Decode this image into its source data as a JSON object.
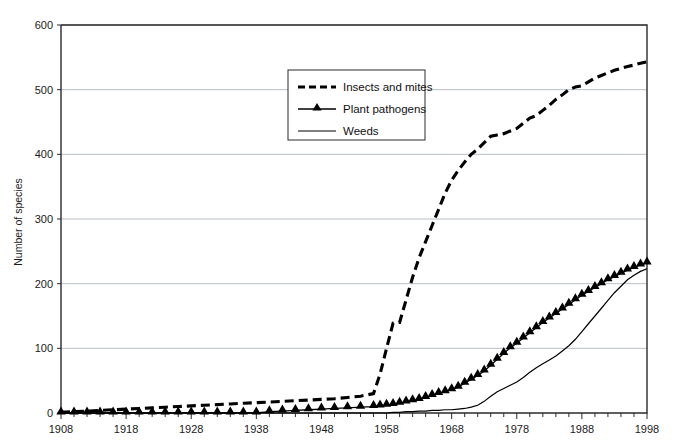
{
  "chart_data": {
    "type": "line",
    "title": "",
    "xlabel": "",
    "ylabel": "Number of species",
    "xlim": [
      1908,
      1998
    ],
    "ylim": [
      0,
      600
    ],
    "ytick_labels": [
      "0",
      "100",
      "200",
      "300",
      "400",
      "500",
      "600"
    ],
    "yticks": [
      0,
      100,
      200,
      300,
      400,
      500,
      600
    ],
    "xtick_labels": [
      "1908",
      "1918",
      "1928",
      "1938",
      "1948",
      "1958",
      "1968",
      "1978",
      "1988",
      "1998"
    ],
    "xticks": [
      1908,
      1918,
      1928,
      1938,
      1948,
      1958,
      1968,
      1978,
      1988,
      1998
    ],
    "minor_xtick_interval": 2,
    "grid": "horizontal",
    "legend_position": "upper-center-left",
    "x": [
      1908,
      1910,
      1912,
      1914,
      1916,
      1918,
      1920,
      1922,
      1924,
      1926,
      1928,
      1930,
      1932,
      1934,
      1936,
      1938,
      1940,
      1942,
      1944,
      1946,
      1948,
      1950,
      1952,
      1954,
      1956,
      1957,
      1958,
      1959,
      1960,
      1961,
      1962,
      1963,
      1964,
      1965,
      1966,
      1967,
      1968,
      1969,
      1970,
      1971,
      1972,
      1973,
      1974,
      1975,
      1976,
      1977,
      1978,
      1979,
      1980,
      1981,
      1982,
      1983,
      1984,
      1985,
      1986,
      1987,
      1988,
      1989,
      1990,
      1991,
      1992,
      1993,
      1994,
      1995,
      1996,
      1997,
      1998
    ],
    "series": [
      {
        "name": "Insects and mites",
        "style": "dashed",
        "marker": "none",
        "color": "#000000",
        "values": [
          1,
          2,
          3,
          4,
          5,
          6,
          7,
          8,
          9,
          10,
          11,
          12,
          13,
          14,
          15,
          16,
          17,
          18,
          19,
          20,
          21,
          22,
          24,
          26,
          30,
          60,
          100,
          139,
          140,
          175,
          210,
          240,
          265,
          290,
          315,
          340,
          360,
          375,
          388,
          400,
          408,
          418,
          428,
          430,
          432,
          436,
          440,
          448,
          456,
          460,
          468,
          476,
          485,
          492,
          500,
          504,
          506,
          512,
          518,
          522,
          526,
          530,
          533,
          536,
          538,
          541,
          543
        ]
      },
      {
        "name": "Plant pathogens",
        "style": "solid",
        "marker": "triangle",
        "color": "#000000",
        "values": [
          0,
          0,
          0,
          0,
          0,
          0,
          0,
          0,
          0,
          0,
          0,
          0,
          0,
          0,
          0,
          0,
          2,
          3,
          4,
          5,
          6,
          7,
          8,
          9,
          10,
          11,
          12,
          13,
          15,
          17,
          19,
          21,
          24,
          27,
          30,
          33,
          36,
          40,
          46,
          52,
          58,
          65,
          74,
          83,
          92,
          101,
          108,
          116,
          124,
          132,
          140,
          147,
          154,
          161,
          168,
          175,
          182,
          188,
          194,
          200,
          206,
          211,
          216,
          221,
          225,
          229,
          232
        ]
      },
      {
        "name": "Weeds",
        "style": "solid",
        "marker": "none",
        "color": "#000000",
        "values": [
          0,
          0,
          0,
          0,
          0,
          0,
          0,
          0,
          0,
          0,
          0,
          0,
          0,
          0,
          0,
          0,
          0,
          0,
          0,
          0,
          0,
          0,
          0,
          0,
          0,
          0,
          0,
          1,
          1,
          2,
          2,
          3,
          3,
          4,
          4,
          5,
          5,
          6,
          7,
          9,
          12,
          18,
          26,
          33,
          38,
          43,
          48,
          55,
          63,
          70,
          76,
          82,
          88,
          96,
          104,
          114,
          126,
          138,
          150,
          162,
          174,
          186,
          196,
          206,
          213,
          219,
          223
        ]
      }
    ]
  },
  "axes": {
    "y_title": "Number of species"
  },
  "legend": {
    "items": [
      {
        "label": "Insects and mites",
        "swatch": "dashed-line"
      },
      {
        "label": "Plant pathogens",
        "swatch": "line-with-triangle"
      },
      {
        "label": "Weeds",
        "swatch": "solid-line"
      }
    ]
  }
}
